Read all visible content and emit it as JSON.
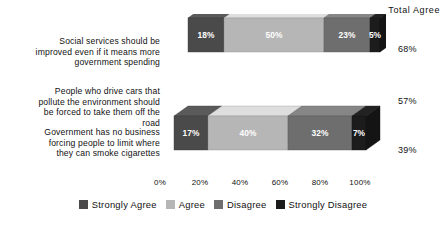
{
  "header": {
    "total_agree_title": "Total Agree"
  },
  "chart_data": {
    "type": "bar",
    "orientation": "horizontal",
    "stacked": true,
    "style": "3d-stacked-bar",
    "title": "",
    "xlabel": "",
    "ylabel": "",
    "xlim": [
      0,
      100
    ],
    "grid": false,
    "legend_position": "bottom",
    "categories": [
      "Social services should be improved even if it means more government spending",
      "People who drive cars that pollute the environment should be forced to take them off the road",
      "Government has no business forcing people to limit where they can smoke cigarettes"
    ],
    "category_lines": [
      [
        "Social services should be",
        "improved even if it means more",
        "government spending"
      ],
      [
        "People who drive cars that",
        "pollute the environment should",
        "be forced to take them off the",
        "road"
      ],
      [
        "Government has no business",
        "forcing people to limit where",
        "they can smoke cigarettes"
      ]
    ],
    "series": [
      {
        "name": "Strongly Agree",
        "color": "#4a4a4a",
        "values": [
          18,
          17,
          13
        ],
        "labels": [
          "18%",
          "17%",
          "13%"
        ]
      },
      {
        "name": "Agree",
        "color": "#b6b6b6",
        "values": [
          50,
          40,
          26
        ],
        "labels": [
          "50%",
          "40%",
          "26%"
        ]
      },
      {
        "name": "Disagree",
        "color": "#6e6e6e",
        "values": [
          23,
          32,
          43
        ],
        "labels": [
          "23%",
          "32%",
          "43%"
        ]
      },
      {
        "name": "Strongly Disagree",
        "color": "#1c1c1c",
        "values": [
          5,
          7,
          17
        ],
        "labels": [
          "5%",
          "7%",
          "17%"
        ]
      }
    ],
    "tick_labels": [
      "0%",
      "20%",
      "40%",
      "60%",
      "80%",
      "100%"
    ],
    "tick_values": [
      0,
      20,
      40,
      60,
      80,
      100
    ],
    "total_agree": [
      "68%",
      "57%",
      "39%"
    ],
    "annotations": {
      "total_agree_header": "Total Agree"
    }
  },
  "legend": {
    "items": [
      {
        "label": "Strongly Agree",
        "color": "#4a4a4a"
      },
      {
        "label": "Agree",
        "color": "#b6b6b6"
      },
      {
        "label": "Disagree",
        "color": "#6e6e6e"
      },
      {
        "label": "Strongly Disagree",
        "color": "#1c1c1c"
      }
    ]
  }
}
